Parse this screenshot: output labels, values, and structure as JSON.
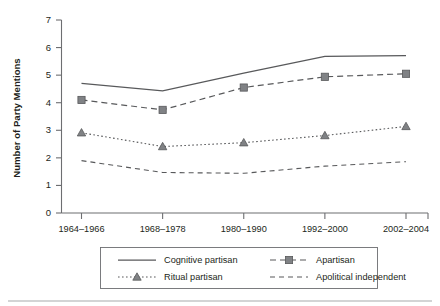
{
  "chart_data": {
    "type": "line",
    "title": "",
    "xlabel": "",
    "ylabel": "Number of Party Mentions",
    "categories": [
      "1964–1966",
      "1968–1978",
      "1980–1990",
      "1992–2000",
      "2002–2004"
    ],
    "ylim": [
      0,
      7
    ],
    "yticks": [
      0,
      1,
      2,
      3,
      4,
      5,
      6,
      7
    ],
    "ytick_labels": [
      "0",
      "1",
      "2",
      "3",
      "4",
      "5",
      "6",
      "7"
    ],
    "grid": false,
    "legend_position": "below-plot",
    "series": [
      {
        "name": "Cognitive partisan",
        "style": "solid",
        "marker": "none",
        "color": "#58595b",
        "values": [
          4.7,
          4.43,
          5.07,
          5.68,
          5.71
        ]
      },
      {
        "name": "Apartisan",
        "style": "dashed",
        "marker": "square",
        "color": "#808285",
        "values": [
          4.1,
          3.74,
          4.55,
          4.94,
          5.05
        ]
      },
      {
        "name": "Ritual partisan",
        "style": "dotted",
        "marker": "triangle",
        "color": "#808285",
        "values": [
          2.91,
          2.41,
          2.55,
          2.81,
          3.14
        ]
      },
      {
        "name": "Apolitical independent",
        "style": "dashed",
        "marker": "none",
        "color": "#808285",
        "values": [
          1.9,
          1.47,
          1.44,
          1.7,
          1.86
        ]
      }
    ]
  },
  "legend": {
    "entries": [
      {
        "label": "Cognitive partisan",
        "style": "solid",
        "marker": "none"
      },
      {
        "label": "Apartisan",
        "style": "dashed",
        "marker": "square"
      },
      {
        "label": "Ritual partisan",
        "style": "dotted",
        "marker": "triangle"
      },
      {
        "label": "Apolitical independent",
        "style": "dashed",
        "marker": "none"
      }
    ]
  },
  "colors": {
    "axis": "#6d6e71",
    "line": "#58595b",
    "marker": "#808285",
    "text": "#231f20",
    "background": "#ffffff",
    "footer_rule": "#a7a9ac"
  }
}
